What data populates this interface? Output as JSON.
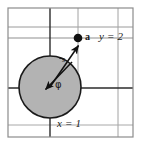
{
  "figure": {
    "canvas": {
      "width": 141,
      "height": 144,
      "background": "#ffffff"
    },
    "colors": {
      "grid_light": "#9a9a9a",
      "grid_dark": "#2b2b2b",
      "border": "#8c8c8c",
      "circle_fill": "#b3b3b3",
      "circle_stroke": "#1a1a1a",
      "ink": "#1a1a1a"
    },
    "border": {
      "x": 8,
      "y": 8,
      "width": 125,
      "height": 129
    },
    "gridlines": [
      {
        "name": "horizontal-top-light",
        "orientation": "horizontal",
        "position": 27,
        "shade": "light"
      },
      {
        "name": "horizontal-y2-dark",
        "orientation": "horizontal",
        "position": 38,
        "shade": "light"
      },
      {
        "name": "horizontal-mid-dark",
        "orientation": "horizontal",
        "position": 88,
        "shade": "dark"
      },
      {
        "name": "vertical-x1-dark",
        "orientation": "vertical",
        "position": 50,
        "shade": "dark"
      },
      {
        "name": "vertical-right-light",
        "orientation": "vertical",
        "position": 78,
        "shade": "light"
      },
      {
        "name": "vertical-far-right-light",
        "orientation": "vertical",
        "position": 118,
        "shade": "light"
      }
    ],
    "circle": {
      "cx": 50,
      "cy": 87,
      "r": 31
    },
    "point": {
      "name": "a",
      "label": "a",
      "cx": 78,
      "cy": 38,
      "r": 4.2
    },
    "vectors": [
      {
        "name": "radius-vector-outward",
        "label": "s",
        "x1": 50,
        "y1": 87,
        "x2": 79,
        "y2": 45
      },
      {
        "name": "radius-vector-inward",
        "label": "φ",
        "x1": 72,
        "y1": 62,
        "x2": 45,
        "y2": 90
      }
    ],
    "labels": {
      "point_a": "a",
      "y_equals": "y = 2",
      "x_equals": "x = 1",
      "phi": "φ",
      "s": "s"
    },
    "label_positions": {
      "point_a": {
        "x": 85,
        "y": 33
      },
      "y_equals": {
        "x": 99,
        "y": 32
      },
      "x_equals": {
        "x": 57,
        "y": 119
      },
      "phi": {
        "x": 54,
        "y": 81
      },
      "s": {
        "x": 62,
        "y": 57
      }
    }
  }
}
